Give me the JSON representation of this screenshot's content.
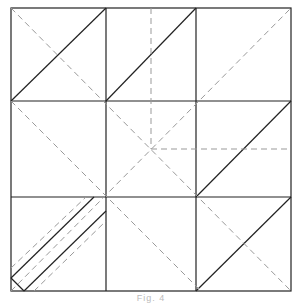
{
  "diagram": {
    "type": "origami-crease-pattern",
    "grid": {
      "rows": 3,
      "cols": 3
    },
    "colors": {
      "solid_line": "#222222",
      "dashed_line": "#999999",
      "background": "#ffffff"
    },
    "legend": {
      "solid": "valley/cut fold (solid)",
      "dashed": "mountain fold (dashed)"
    },
    "caption": "Fig. 4"
  }
}
